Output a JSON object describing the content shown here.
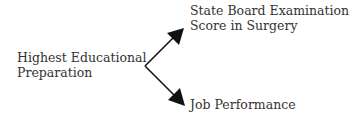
{
  "diagram": {
    "source": {
      "line1": "Highest Educational",
      "line2": "Preparation"
    },
    "targets": [
      {
        "line1": "State Board Examination",
        "line2": "Score in Surgery"
      },
      {
        "line1": "Job Performance"
      }
    ],
    "edges": [
      {
        "from": "Highest Educational Preparation",
        "to": "State Board Examination Score in Surgery"
      },
      {
        "from": "Highest Educational Preparation",
        "to": "Job Performance"
      }
    ],
    "colors": {
      "line": "#111111",
      "text": "#333333"
    }
  }
}
